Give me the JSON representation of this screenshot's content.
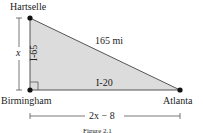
{
  "figure": {
    "caption": "Figure 2.1",
    "vertices": {
      "top": {
        "name": "Hartselle"
      },
      "bottom_left": {
        "name": "Birmingham"
      },
      "bottom_right": {
        "name": "Atlanta"
      }
    },
    "sides": {
      "vertical": {
        "road": "I-65",
        "length_label": "x"
      },
      "horizontal": {
        "road": "I-20",
        "length_label": "2x − 8"
      },
      "hypotenuse": {
        "length_label": "165 mi"
      }
    },
    "right_angle_at": "Birmingham",
    "colors": {
      "fill": "#d9d9d9",
      "stroke": "#555555",
      "dot": "#111111"
    }
  }
}
